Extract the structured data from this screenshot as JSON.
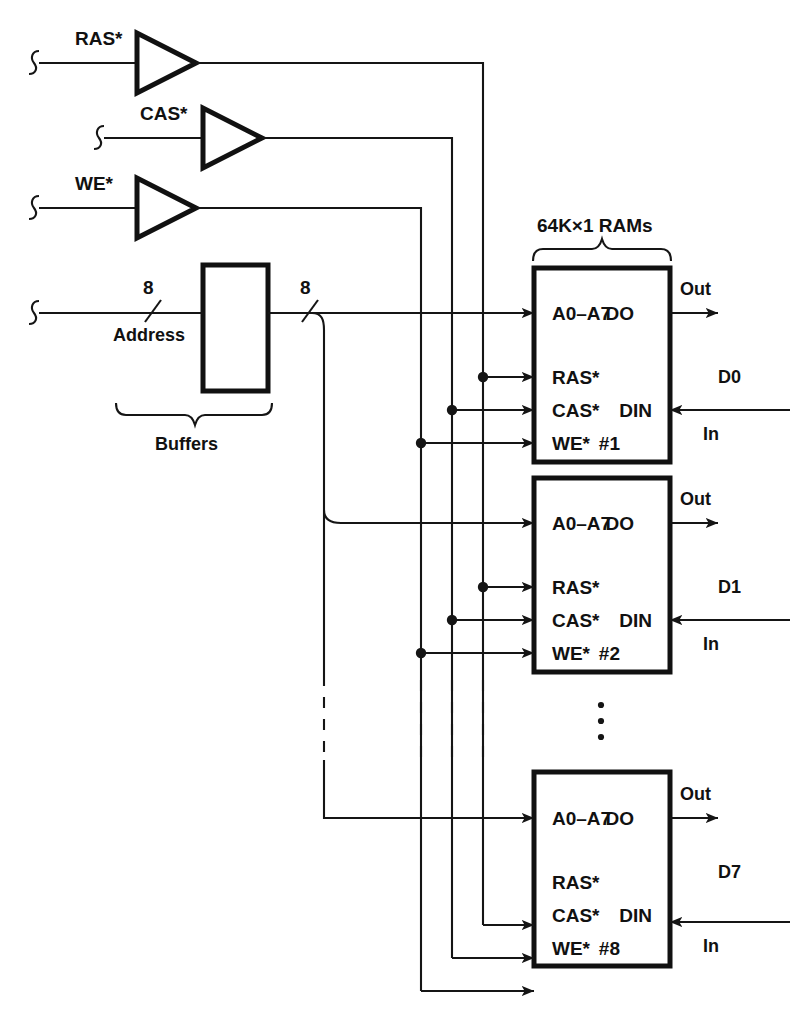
{
  "diagram": {
    "header_label": "64K×1 RAMs",
    "buffers_label": "Buffers",
    "address_label": "Address",
    "address_width_in": "8",
    "address_width_out": "8",
    "control_signals": [
      {
        "name": "ras",
        "label": "RAS*"
      },
      {
        "name": "cas",
        "label": "CAS*"
      },
      {
        "name": "we",
        "label": "WE*"
      }
    ],
    "pin_labels": {
      "address": "A0–A7",
      "ras": "RAS*",
      "cas": "CAS*",
      "we": "WE*",
      "dout": "DO",
      "din": "DIN"
    },
    "port_labels": {
      "out": "Out",
      "in": "In"
    },
    "ram_blocks": [
      {
        "id": "ram-1",
        "index_label": "#1",
        "data_label": "D0"
      },
      {
        "id": "ram-2",
        "index_label": "#2",
        "data_label": "D1"
      },
      {
        "id": "ram-8",
        "index_label": "#8",
        "data_label": "D7"
      }
    ],
    "continuation": {
      "ellipsis_glyph": "⋮",
      "note": "vertical dots indicate RAM #3 through #7 omitted"
    },
    "colors": {
      "ink": "#151515",
      "block_stroke": "#111111",
      "background": "#ffffff"
    }
  }
}
